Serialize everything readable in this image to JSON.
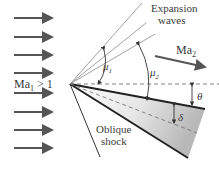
{
  "diagram": {
    "labels": {
      "expansion_line1": "Expansion",
      "expansion_line2": "waves",
      "ma2": "Ma",
      "ma2_sub": "2",
      "ma1": "Ma",
      "ma1_sub": "1",
      "ma1_rel": " > 1",
      "mu1": "μ",
      "mu1_sub": "1",
      "mu2": "μ",
      "mu2_sub": "2",
      "theta": "θ",
      "delta": "δ",
      "shock_line1": "Oblique",
      "shock_line2": "shock"
    },
    "colors": {
      "arrow": "#555555",
      "line": "#2a2a2a",
      "thin_line": "#8a8a8a",
      "wedge_light": "#ffffff",
      "wedge_dark": "#bdbdbd"
    },
    "incoming_flow_arrows": 8
  }
}
